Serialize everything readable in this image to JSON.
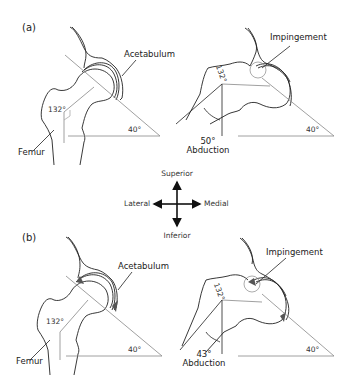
{
  "panels": [
    {
      "id": "a",
      "label": "(a)",
      "neutral": {
        "acetabulum_label": "Acetabulum",
        "femur_label": "Femur",
        "neck_shaft_angle": "132°",
        "acetabular_angle": "40°"
      },
      "abducted": {
        "impingement_label": "Impingement",
        "neck_shaft_angle": "132°",
        "acetabular_angle": "40°",
        "abduction_angle": "50°",
        "abduction_label": "Abduction"
      }
    },
    {
      "id": "b",
      "label": "(b)",
      "neutral": {
        "acetabulum_label": "Acetabulum",
        "femur_label": "Femur",
        "neck_shaft_angle": "132°",
        "acetabular_angle": "40°"
      },
      "abducted": {
        "impingement_label": "Impingement",
        "neck_shaft_angle": "132°",
        "acetabular_angle": "40°",
        "abduction_angle": "43°",
        "abduction_label": "Abduction"
      }
    }
  ],
  "compass": {
    "up": "Superior",
    "down": "Inferior",
    "left": "Lateral",
    "right": "Medial"
  },
  "colors": {
    "line": "#222222",
    "guide": "#9a9a9a",
    "impingement_fill": "#555555"
  }
}
